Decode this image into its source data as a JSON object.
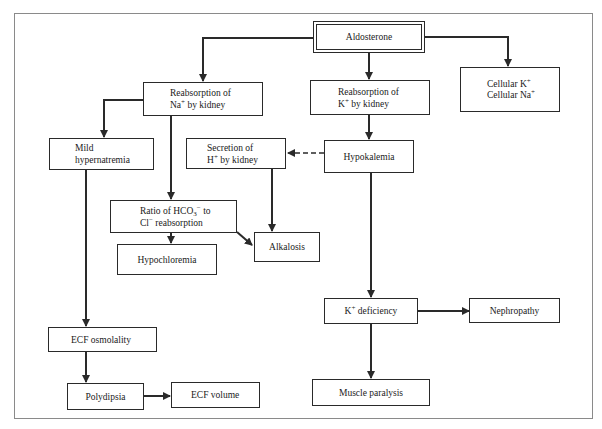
{
  "diagram": {
    "type": "flowchart",
    "nodes": {
      "aldosterone": {
        "label": "Aldosterone"
      },
      "reabs_na": {
        "indicator": "up",
        "line1": "Reabsorption of",
        "line2_a": "Na",
        "line2_sup": "+",
        "line2_b": " by kidney"
      },
      "reabs_k": {
        "indicator": "down",
        "line1": "Reabsorption of",
        "line2_a": "K",
        "line2_sup": "+",
        "line2_b": " by kidney"
      },
      "cellular": {
        "line1_a": "Cellular K",
        "line1_sup": "+",
        "line1_indicator": "down",
        "line2_a": "Cellular Na",
        "line2_sup": "+",
        "line2_indicator": "up"
      },
      "mild_hypernatremia": {
        "line1": "Mild",
        "line2": "hypernatremia"
      },
      "secretion_h": {
        "indicator": "up",
        "line1": "Secretion of",
        "line2_a": "H",
        "line2_sup": "+",
        "line2_b": " by kidney"
      },
      "hypokalemia": {
        "label": "Hypokalemia"
      },
      "ratio_hco3": {
        "indicator": "up",
        "line1_a": "Ratio of HCO",
        "line1_sub": "3",
        "line1_sup": "−",
        "line1_b": " to",
        "line2_a": "Cl",
        "line2_sup": "−",
        "line2_b": "  reabsorption"
      },
      "alkalosis": {
        "label": "Alkalosis"
      },
      "hypochloremia": {
        "label": "Hypochloremia"
      },
      "k_deficiency": {
        "label_a": "K",
        "label_sup": "+",
        "label_b": "  deficiency"
      },
      "nephropathy": {
        "label": "Nephropathy"
      },
      "ecf_osmolality": {
        "indicator": "up",
        "label": "ECF osmolality"
      },
      "muscle_paralysis": {
        "label": "Muscle paralysis"
      },
      "polydipsia": {
        "label": "Polydipsia"
      },
      "ecf_volume": {
        "indicator": "up",
        "label": "ECF volume"
      }
    },
    "edges": [
      {
        "from": "Aldosterone",
        "to": "Reabsorption of Na+ by kidney",
        "style": "solid"
      },
      {
        "from": "Aldosterone",
        "to": "Reabsorption of K+ by kidney",
        "style": "solid"
      },
      {
        "from": "Aldosterone",
        "to": "Cellular K+ / Cellular Na+",
        "style": "solid"
      },
      {
        "from": "Reabsorption of Na+ by kidney",
        "to": "Mild hypernatremia",
        "style": "solid"
      },
      {
        "from": "Reabsorption of Na+ by kidney",
        "to": "Ratio of HCO3- to Cl- reabsorption",
        "style": "solid"
      },
      {
        "from": "Reabsorption of K+ by kidney",
        "to": "Hypokalemia",
        "style": "solid"
      },
      {
        "from": "Hypokalemia",
        "to": "Secretion of H+ by kidney",
        "style": "dashed"
      },
      {
        "from": "Hypokalemia",
        "to": "K+ deficiency",
        "style": "solid"
      },
      {
        "from": "Secretion of H+ by kidney",
        "to": "Alkalosis",
        "style": "solid"
      },
      {
        "from": "Ratio of HCO3- to Cl- reabsorption",
        "to": "Alkalosis",
        "style": "solid"
      },
      {
        "from": "Ratio of HCO3- to Cl- reabsorption",
        "to": "Hypochloremia",
        "style": "solid"
      },
      {
        "from": "Mild hypernatremia",
        "to": "ECF osmolality",
        "style": "solid"
      },
      {
        "from": "ECF osmolality",
        "to": "Polydipsia",
        "style": "solid"
      },
      {
        "from": "Polydipsia",
        "to": "ECF volume",
        "style": "solid"
      },
      {
        "from": "K+ deficiency",
        "to": "Nephropathy",
        "style": "solid"
      },
      {
        "from": "K+ deficiency",
        "to": "Muscle paralysis",
        "style": "solid"
      }
    ],
    "colors": {
      "line": "#2a2a2a",
      "frame": "#8a8a8a",
      "background": "#ffffff"
    }
  }
}
